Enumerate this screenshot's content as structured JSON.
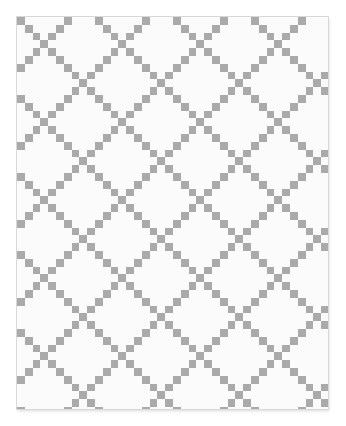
{
  "image": {
    "subject": "Double Irish Chain quilt",
    "background_color": "#ffffff",
    "fabric_color": "#fbfbfb",
    "block_color": "#aaaaaa",
    "border_color": "#d8d8d8"
  },
  "quilt": {
    "left": 17,
    "top": 17,
    "width": 311,
    "height": 392,
    "cell_size": 7.8,
    "period_cells": 10,
    "band_half_width": 1,
    "offset_x": 2,
    "offset_y": 2
  }
}
